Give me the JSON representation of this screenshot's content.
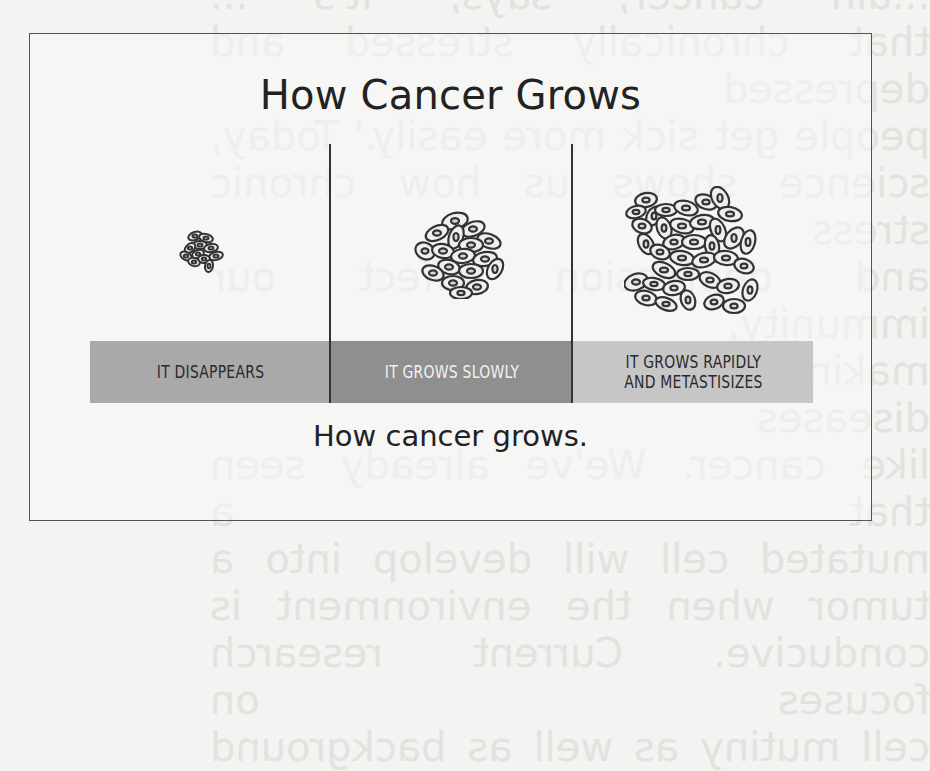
{
  "figure": {
    "title": "How Cancer Grows",
    "caption": "How cancer grows.",
    "stages": [
      {
        "label_lines": [
          "IT DISAPPEARS"
        ],
        "band_color": "#a9a9a9",
        "text_color": "#2a2a2a",
        "cluster": "small-cell-cluster"
      },
      {
        "label_lines": [
          "IT GROWS SLOWLY"
        ],
        "band_color": "#8f8f8f",
        "text_color": "#f2f2f2",
        "cluster": "medium-cell-cluster"
      },
      {
        "label_lines": [
          "IT GROWS RAPIDLY",
          "AND METASTISIZES"
        ],
        "band_color": "#c6c6c6",
        "text_color": "#2a2a2a",
        "cluster": "large-cell-cluster"
      }
    ]
  },
  "background_bleed_text": [
    "...ain cancer, says, 'it's ...",
    "that chronically stressed and depressed",
    "people get sick more easily.' Today,",
    "science shows us how chronic stress",
    "and depression affect our immunity,",
    "making us more vulnerable to diseases",
    "like cancer. We've already seen that a",
    "mutated cell will develop into a",
    "tumor when the environment is",
    "conducive. Current research focuses on",
    "cell mutiny as well as background"
  ],
  "colors": {
    "page": "#f3f3f1",
    "frame_border": "#555555",
    "text": "#222222"
  }
}
